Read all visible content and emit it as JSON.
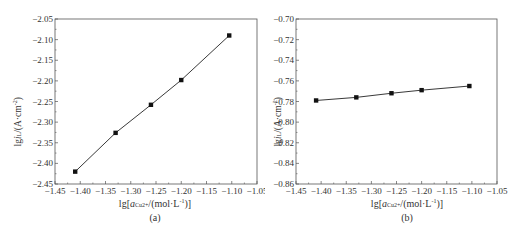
{
  "chart_data": [
    {
      "type": "line",
      "panel": "(a)",
      "title": "",
      "xlabel": "lg[a_Cu2+/(mol·L⁻¹)]",
      "ylabel": "lg i_L/(A·cm⁻²)",
      "xlim": [
        -1.45,
        -1.05
      ],
      "ylim": [
        -2.45,
        -2.05
      ],
      "xticks": [
        "-1.45",
        "-1.40",
        "-1.35",
        "-1.30",
        "-1.25",
        "-1.20",
        "-1.15",
        "-1.10",
        "-1.05"
      ],
      "yticks": [
        "-2.05",
        "-2.10",
        "-2.15",
        "-2.20",
        "-2.25",
        "-2.30",
        "-2.35",
        "-2.40",
        "-2.45"
      ],
      "grid": false,
      "legend": null,
      "x": [
        -1.41,
        -1.33,
        -1.26,
        -1.2,
        -1.105
      ],
      "series": [
        {
          "name": "lg i_L",
          "values": [
            -2.42,
            -2.326,
            -2.258,
            -2.198,
            -2.09
          ],
          "marker": "square",
          "fit_line": true
        }
      ]
    },
    {
      "type": "line",
      "panel": "(b)",
      "title": "",
      "xlabel": "lg[a_Cu2+/(mol·L⁻¹)]",
      "ylabel": "lg i_L/(A·cm⁻²)",
      "xlim": [
        -1.45,
        -1.05
      ],
      "ylim": [
        -0.86,
        -0.7
      ],
      "xticks": [
        "-1.45",
        "-1.40",
        "-1.35",
        "-1.30",
        "-1.25",
        "-1.20",
        "-1.15",
        "-1.10",
        "-1.05"
      ],
      "yticks": [
        "-0.70",
        "-0.72",
        "-0.74",
        "-0.76",
        "-0.78",
        "-0.80",
        "-0.82",
        "-0.84",
        "-0.86"
      ],
      "grid": false,
      "legend": null,
      "x": [
        -1.41,
        -1.33,
        -1.26,
        -1.2,
        -1.105
      ],
      "series": [
        {
          "name": "lg i_L",
          "values": [
            -0.779,
            -0.776,
            -0.772,
            -0.769,
            -0.765
          ],
          "marker": "square",
          "fit_line": true
        }
      ]
    }
  ],
  "labels": {
    "a": {
      "ylabel_main": "lg",
      "ylabel_i": "i",
      "ylabel_sub": "L",
      "ylabel_rest": "/(A·cm",
      "ylabel_sup": "-2",
      "ylabel_end": ")",
      "xlabel_pre": "lg[",
      "xlabel_a": "a",
      "xlabel_sub": "Cu2+",
      "xlabel_rest": "/(mol·L",
      "xlabel_sup": "-1",
      "xlabel_end": ")]",
      "caption": "(a)"
    },
    "b": {
      "ylabel_main": "lg",
      "ylabel_i": "i",
      "ylabel_sub": "L",
      "ylabel_rest": "/(A·cm",
      "ylabel_sup": "-2",
      "ylabel_end": ")",
      "xlabel_pre": "lg[",
      "xlabel_a": "a",
      "xlabel_sub": "Cu2+",
      "xlabel_rest": "/(mol·L",
      "xlabel_sup": "-1",
      "xlabel_end": ")]",
      "caption": "(b)"
    }
  },
  "colors": {
    "axis": "#555555",
    "line": "#222222",
    "marker": "#111111",
    "text": "#333333"
  }
}
